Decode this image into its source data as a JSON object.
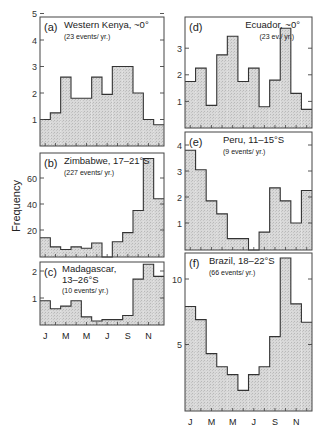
{
  "figure": {
    "ylabel": "Frequency",
    "month_labels": [
      "J",
      "M",
      "M",
      "J",
      "S",
      "N"
    ]
  },
  "chart_data": [
    {
      "type": "bar",
      "id": "a",
      "panel_label": "(a)",
      "title": "Western Kenya, ~0°",
      "subtitle": "(23 events/ yr.)",
      "categories": [
        "Jan",
        "Feb",
        "Mar",
        "Apr",
        "May",
        "Jun",
        "Jul",
        "Aug",
        "Sep",
        "Oct",
        "Nov",
        "Dec"
      ],
      "values": [
        1.0,
        1.25,
        2.6,
        1.8,
        1.8,
        2.6,
        1.95,
        3.0,
        3.0,
        2.0,
        1.0,
        0.8
      ],
      "ylim": [
        0,
        5
      ],
      "yticks": [
        1,
        2,
        3,
        4,
        5
      ],
      "xlabel": "",
      "ylabel": "Frequency"
    },
    {
      "type": "bar",
      "id": "b",
      "panel_label": "(b)",
      "title": "Zimbabwe, 17–21°S",
      "subtitle": "(227 events/ yr.)",
      "categories": [
        "Jan",
        "Feb",
        "Mar",
        "Apr",
        "May",
        "Jun",
        "Jul",
        "Aug",
        "Sep",
        "Oct",
        "Nov",
        "Dec"
      ],
      "values": [
        14,
        7,
        5,
        7,
        6,
        10,
        0,
        11,
        18,
        35,
        75,
        44
      ],
      "ylim": [
        0,
        78
      ],
      "yticks": [
        20,
        40,
        60
      ],
      "xlabel": "",
      "ylabel": "Frequency"
    },
    {
      "type": "bar",
      "id": "c",
      "panel_label": "(c)",
      "title": "Madagascar,",
      "title2": "13–26°S",
      "subtitle": "(10 events/ yr.)",
      "categories": [
        "Jan",
        "Feb",
        "Mar",
        "Apr",
        "May",
        "Jun",
        "Jul",
        "Aug",
        "Sep",
        "Oct",
        "Nov",
        "Dec"
      ],
      "values": [
        0.9,
        0.6,
        0.7,
        0.9,
        0.3,
        0.15,
        0.2,
        0.2,
        0.35,
        1.7,
        2.25,
        1.8
      ],
      "ylim": [
        0,
        2.3
      ],
      "yticks": [
        1,
        2
      ],
      "xlabel": "Month",
      "ylabel": "Frequency"
    },
    {
      "type": "bar",
      "id": "d",
      "panel_label": "(d)",
      "title": "Ecuador, ~0°",
      "subtitle": "(23 ev./ yr.)",
      "categories": [
        "Jan",
        "Feb",
        "Mar",
        "Apr",
        "May",
        "Jun",
        "Jul",
        "Aug",
        "Sep",
        "Oct",
        "Nov",
        "Dec"
      ],
      "values": [
        1.75,
        2.25,
        0.85,
        2.75,
        3.45,
        1.75,
        2.25,
        0.8,
        1.8,
        3.75,
        1.3,
        0.7
      ],
      "ylim": [
        0,
        4.2
      ],
      "yticks": [
        1,
        2,
        3
      ],
      "xlabel": "",
      "ylabel": ""
    },
    {
      "type": "bar",
      "id": "e",
      "panel_label": "(e)",
      "title": "Peru, 11–15°S",
      "subtitle": "(9 events/ yr.)",
      "categories": [
        "Jan",
        "Feb",
        "Mar",
        "Apr",
        "May",
        "Jun",
        "Jul",
        "Aug",
        "Sep",
        "Oct",
        "Nov",
        "Dec"
      ],
      "values": [
        3.8,
        3.05,
        1.85,
        1.35,
        0.4,
        0.4,
        0,
        0.65,
        2.35,
        1.85,
        1.0,
        2.25
      ],
      "ylim": [
        0,
        4.5
      ],
      "yticks": [
        1,
        2,
        3,
        4
      ],
      "xlabel": "",
      "ylabel": ""
    },
    {
      "type": "bar",
      "id": "f",
      "panel_label": "(f)",
      "title": "Brazil, 18–22°S",
      "subtitle": "(66 events/ yr.)",
      "categories": [
        "Jan",
        "Feb",
        "Mar",
        "Apr",
        "May",
        "Jun",
        "Jul",
        "Aug",
        "Sep",
        "Oct",
        "Nov",
        "Dec"
      ],
      "values": [
        7.9,
        6.9,
        4.3,
        3.3,
        2.7,
        1.5,
        2.7,
        3.3,
        5.6,
        11.6,
        8.1,
        6.7
      ],
      "ylim": [
        0,
        12
      ],
      "yticks": [
        5,
        10
      ],
      "xlabel": "Month",
      "ylabel": ""
    }
  ]
}
